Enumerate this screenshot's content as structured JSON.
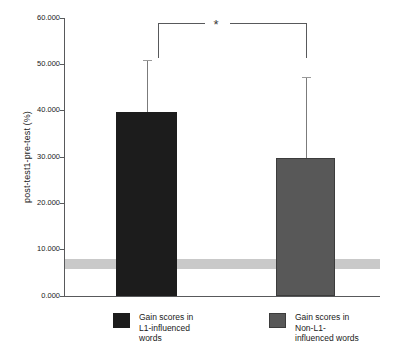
{
  "chart_data": {
    "type": "bar",
    "title": "",
    "xlabel": "",
    "ylabel": "post-test1-pre-test (%)",
    "ylim": [
      0,
      60
    ],
    "ytick_labels": [
      "60.000",
      "50.000",
      "40.000",
      "30.000",
      "20.000",
      "10.000",
      "0.000"
    ],
    "ytick_values": [
      60,
      50,
      40,
      30,
      20,
      10,
      0
    ],
    "grid": false,
    "legend_position": "bottom",
    "categories": [
      "Gain scores in L1-influenced words",
      "Gain scores in Non-L1-influenced words"
    ],
    "values": [
      39.8,
      29.8
    ],
    "error_upper": [
      50.7,
      47.0
    ],
    "bar_colors": [
      "#1c1c1c",
      "#585858"
    ],
    "reference_band": {
      "label": "",
      "low": 5.8,
      "high": 8.0,
      "color": "#c9c9c9"
    },
    "annotations": [
      {
        "type": "significance-bracket",
        "text": "*",
        "between": [
          0,
          1
        ],
        "y": 59.0
      }
    ]
  },
  "axis": {
    "ylabel": "post-test1-pre-test (%)",
    "ticks": [
      {
        "label": "60.000",
        "value": 60
      },
      {
        "label": "50.000",
        "value": 50
      },
      {
        "label": "40.000",
        "value": 40
      },
      {
        "label": "30.000",
        "value": 30
      },
      {
        "label": "20.000",
        "value": 20
      },
      {
        "label": "10.000",
        "value": 10
      },
      {
        "label": "0.000",
        "value": 0
      }
    ]
  },
  "significance": {
    "marker": "*"
  },
  "legend": {
    "items": [
      {
        "label": "Gain scores in\nL1-influenced\nwords",
        "color": "#1c1c1c",
        "swatch": "dark-square-swatch"
      },
      {
        "label": "Gain scores in\nNon-L1-\ninfluenced words",
        "color": "#585858",
        "swatch": "gray-square-swatch"
      }
    ]
  }
}
